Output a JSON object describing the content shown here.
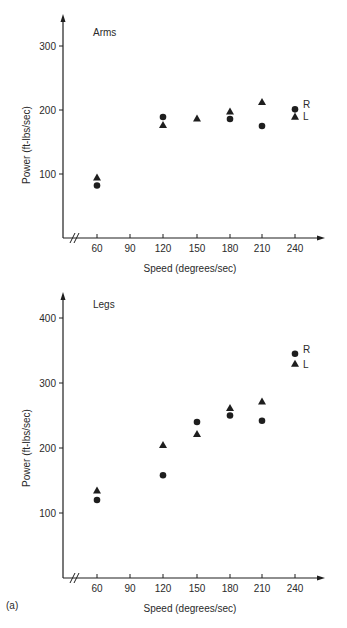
{
  "figure_label": "(a)",
  "footer_fragment": "Figure 8.10 Speed and power ...",
  "chart_data": [
    {
      "type": "scatter",
      "title": "Arms",
      "xlabel": "Speed (degrees/sec)",
      "ylabel": "Power (ft-lbs/sec)",
      "x_ticks": [
        60,
        90,
        120,
        150,
        180,
        210,
        240
      ],
      "y_ticks": [
        100,
        200,
        300
      ],
      "ylim": [
        0,
        350
      ],
      "axis_break": true,
      "grid": false,
      "legend": [
        {
          "name": "R",
          "marker": "circle"
        },
        {
          "name": "L",
          "marker": "triangle"
        }
      ],
      "legend_position": "right, beside 240 points",
      "series": [
        {
          "name": "R",
          "marker": "circle",
          "x": [
            60,
            120,
            180,
            210,
            240
          ],
          "y": [
            82,
            189,
            186,
            175,
            201
          ]
        },
        {
          "name": "L",
          "marker": "triangle",
          "x": [
            60,
            120,
            150,
            180,
            210,
            240
          ],
          "y": [
            95,
            177,
            187,
            198,
            213,
            190
          ]
        }
      ]
    },
    {
      "type": "scatter",
      "title": "Legs",
      "xlabel": "Speed (degrees/sec)",
      "ylabel": "Power (ft-lbs/sec)",
      "x_ticks": [
        60,
        90,
        120,
        150,
        180,
        210,
        240
      ],
      "y_ticks": [
        100,
        200,
        300,
        400
      ],
      "ylim": [
        0,
        440
      ],
      "axis_break": true,
      "grid": false,
      "legend": [
        {
          "name": "R",
          "marker": "circle"
        },
        {
          "name": "L",
          "marker": "triangle"
        }
      ],
      "legend_position": "right, beside 240 points",
      "series": [
        {
          "name": "R",
          "marker": "circle",
          "x": [
            60,
            120,
            150,
            180,
            210,
            240
          ],
          "y": [
            120,
            158,
            240,
            250,
            242,
            345
          ]
        },
        {
          "name": "L",
          "marker": "triangle",
          "x": [
            60,
            120,
            150,
            180,
            210,
            240
          ],
          "y": [
            135,
            205,
            222,
            262,
            272,
            330
          ]
        }
      ]
    }
  ],
  "layout": [
    {
      "axis_x": 63,
      "x_axis_y": 238,
      "top_y": 14,
      "right_x": 325,
      "px_per_unit_y": 0.64,
      "title_pos": [
        93,
        36
      ],
      "ylabel_pos": [
        30,
        145
      ],
      "xlabel_pos": [
        190,
        272
      ]
    },
    {
      "axis_x": 63,
      "x_axis_y": 578,
      "top_y": 292,
      "right_x": 325,
      "px_per_unit_y": 0.65,
      "title_pos": [
        93,
        308
      ],
      "ylabel_pos": [
        30,
        448
      ],
      "xlabel_pos": [
        190,
        612
      ]
    }
  ],
  "x_tick_px": {
    "60": 97,
    "90": 130,
    "120": 163,
    "150": 197,
    "180": 230,
    "210": 262,
    "240": 295
  },
  "colors": {
    "ink": "#1e1e1e",
    "text": "#2a2a2a",
    "background": "#ffffff"
  }
}
